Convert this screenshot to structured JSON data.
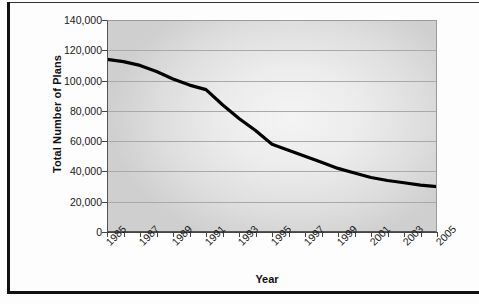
{
  "figure": {
    "background_color": "#fdfdfd",
    "frame_color": "#111111",
    "plot_area_color": "#dedede",
    "series_color": "#000000"
  },
  "chart_data": {
    "type": "line",
    "title": "",
    "xlabel": "Year",
    "ylabel": "Total Number of Plans",
    "grid": true,
    "legend": "none",
    "xlim": [
      1985,
      2005
    ],
    "ylim": [
      0,
      140000
    ],
    "ytick_values": [
      0,
      20000,
      40000,
      60000,
      80000,
      100000,
      120000,
      140000
    ],
    "ytick_labels": [
      "0",
      "20,000",
      "40,000",
      "60,000",
      "80,000",
      "100,000",
      "120,000",
      "140,000"
    ],
    "xtick_labels": [
      "1985",
      "1987",
      "1989",
      "1991",
      "1993",
      "1995",
      "1997",
      "1999",
      "2001",
      "2003",
      "2005"
    ],
    "x": [
      1985,
      1986,
      1987,
      1988,
      1989,
      1990,
      1991,
      1992,
      1993,
      1994,
      1995,
      1996,
      1997,
      1998,
      1999,
      2000,
      2001,
      2002,
      2003,
      2004,
      2005
    ],
    "values": [
      114000,
      112500,
      110000,
      106000,
      101000,
      97000,
      94000,
      84000,
      75000,
      67000,
      58000,
      54000,
      50000,
      46000,
      42000,
      39000,
      36000,
      34000,
      32500,
      31000,
      30000
    ],
    "series": [
      {
        "name": "Total Number of Plans",
        "color": "#000000",
        "values": [
          114000,
          112500,
          110000,
          106000,
          101000,
          97000,
          94000,
          84000,
          75000,
          67000,
          58000,
          54000,
          50000,
          46000,
          42000,
          39000,
          36000,
          34000,
          32500,
          31000,
          30000
        ]
      }
    ]
  }
}
